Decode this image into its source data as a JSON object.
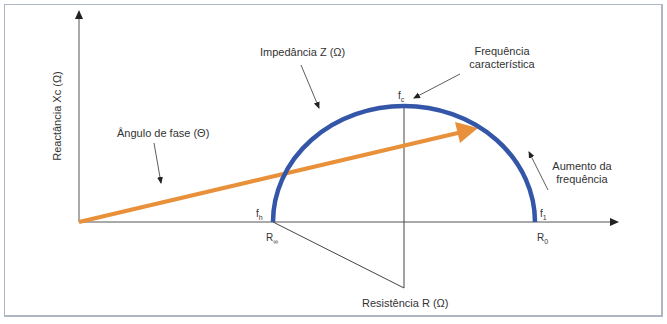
{
  "diagram": {
    "type": "impedance-semicircle (Nyquist / Cole plot)",
    "axes": {
      "y_label": "Reactância Xc (Ω)",
      "x_label": "Resistência R (Ω)"
    },
    "annotations": {
      "impedance": "Impedância Z (Ω)",
      "phase_angle": "Ângulo de fase (Θ)",
      "characteristic_frequency_line1": "Frequência",
      "characteristic_frequency_line2": "característica",
      "increasing_frequency_line1": "Aumento da",
      "increasing_frequency_line2": "frequência"
    },
    "points": {
      "f_c": {
        "base": "f",
        "sub": "c"
      },
      "f_h": {
        "base": "f",
        "sub": "h"
      },
      "f_1": {
        "base": "f",
        "sub": "1"
      },
      "R_inf": {
        "base": "R",
        "sub": "∞"
      },
      "R_0": {
        "base": "R",
        "sub": "0"
      }
    },
    "colors": {
      "semicircle": "#3456a8",
      "phase_vector": "#e8913a",
      "lines": "#444444",
      "frame": "#aeb6c4"
    }
  }
}
